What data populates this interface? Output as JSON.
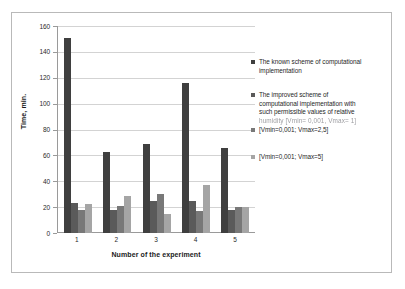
{
  "chart_data": {
    "type": "bar",
    "title": "",
    "xlabel": "Number of the experiment",
    "ylabel": "Time, min.",
    "categories": [
      "1",
      "2",
      "3",
      "4",
      "5"
    ],
    "ylim": [
      0,
      160
    ],
    "yticks": [
      "0",
      "20",
      "40",
      "60",
      "80",
      "100",
      "120",
      "140",
      "160"
    ],
    "grid": true,
    "legend_position": "right",
    "series": [
      {
        "name": "The known scheme of computational implementation",
        "color": "#3f3f3f",
        "values": [
          151,
          63,
          69,
          116,
          65.5
        ]
      },
      {
        "name": "The  improved scheme of computational implementation with such permissible values of relative humidity [Vmin=0,001, Vmax=1]",
        "color": "#5a5a5a",
        "values": [
          23,
          17.5,
          24.5,
          24.5,
          18
        ]
      },
      {
        "name": "[Vmin=0,001; Vmax=2,5]",
        "color": "#787878",
        "values": [
          17.5,
          20.5,
          30.5,
          17,
          20
        ]
      },
      {
        "name": "[Vmin=0,001; Vmax=5]",
        "color": "#a5a5a5",
        "values": [
          22.5,
          28.5,
          15,
          37,
          20
        ]
      }
    ]
  },
  "axes": {
    "y_title": "Time, min.",
    "x_title": "Number of the experiment",
    "y_tick_labels": [
      "160",
      "140",
      "120",
      "100",
      "80",
      "60",
      "40",
      "20",
      "0"
    ],
    "x_tick_labels": [
      "1",
      "2",
      "3",
      "4",
      "5"
    ]
  },
  "legend": {
    "entries": [
      {
        "swatch_color": "#3f3f3f",
        "lines": [
          "The known scheme of computational",
          "implementation"
        ]
      },
      {
        "swatch_color": "#5a5a5a",
        "lines": [
          "The  improved scheme of",
          "computational implementation with",
          "such permissible values of relative"
        ],
        "blurred_line": "humidity [Vmin= 0,001, Vmax= 1]"
      },
      {
        "swatch_color": "#787878",
        "lines": [
          "[Vmin=0,001; Vmax=2,5]"
        ]
      },
      {
        "swatch_color": "#a5a5a5",
        "lines": [
          "[Vmin=0,001; Vmax=5]"
        ]
      }
    ]
  },
  "colors": {
    "frame_border": "#b9b9b9",
    "axis_line": "#9a9a9a",
    "gridline": "#d3d3d3",
    "background": "#ffffff",
    "text": "#1f1f1f"
  }
}
